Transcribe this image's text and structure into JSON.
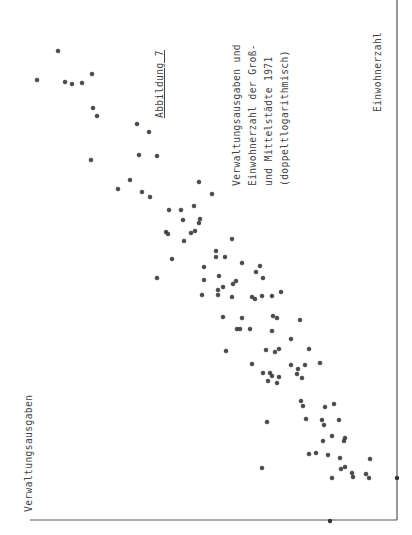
{
  "figure": {
    "label": "Abbildung 7",
    "title_lines": [
      "Verwaltungsausgaben und",
      "Einwohnerzahl der Groß-",
      "und Mittelstädte 1971",
      "(doppeltlogarithmisch)"
    ],
    "x_axis_label": "Einwohnerzahl",
    "y_axis_label": "Verwaltungsausgaben"
  },
  "style": {
    "point_color": "#4a4a4a",
    "axis_color": "#555555",
    "text_color": "#444444"
  },
  "chart_data": {
    "type": "scatter",
    "figure_label": "Abbildung 7",
    "xlabel": "Einwohnerzahl",
    "ylabel": "Verwaltungsausgaben",
    "scale": "log-log",
    "grid": false,
    "legend": null,
    "orientation_note": "Figure printed rotated 90° counter-clockwise; point coordinates are given in page pixel space (px, py).",
    "axes": {
      "x_axis_line": {
        "x": 397,
        "y0": 0,
        "y1": 520
      },
      "y_axis_line": {
        "y": 520,
        "x0": 30,
        "x1": 397
      },
      "axis_markers": [
        {
          "px": 397,
          "py": 478
        },
        {
          "px": 330,
          "py": 521
        }
      ]
    },
    "points": [
      [
        58,
        51
      ],
      [
        37,
        80
      ],
      [
        65,
        82
      ],
      [
        72,
        84
      ],
      [
        82,
        83
      ],
      [
        92,
        74
      ],
      [
        93,
        108
      ],
      [
        97,
        116
      ],
      [
        137,
        124
      ],
      [
        149,
        132
      ],
      [
        91,
        160
      ],
      [
        139,
        155
      ],
      [
        157,
        156
      ],
      [
        130,
        180
      ],
      [
        118,
        189
      ],
      [
        142,
        192
      ],
      [
        150,
        197
      ],
      [
        199,
        182
      ],
      [
        212,
        194
      ],
      [
        194,
        206
      ],
      [
        169,
        210
      ],
      [
        181,
        210
      ],
      [
        183,
        220
      ],
      [
        200,
        219
      ],
      [
        199,
        223
      ],
      [
        166,
        232
      ],
      [
        168,
        234
      ],
      [
        191,
        233
      ],
      [
        195,
        231
      ],
      [
        184,
        241
      ],
      [
        232,
        239
      ],
      [
        216,
        251
      ],
      [
        216,
        257
      ],
      [
        225,
        257
      ],
      [
        172,
        259
      ],
      [
        242,
        263
      ],
      [
        157,
        278
      ],
      [
        204,
        267
      ],
      [
        260,
        266
      ],
      [
        256,
        272
      ],
      [
        219,
        276
      ],
      [
        204,
        280
      ],
      [
        263,
        278
      ],
      [
        236,
        281
      ],
      [
        233,
        284
      ],
      [
        218,
        290
      ],
      [
        223,
        287
      ],
      [
        202,
        295
      ],
      [
        218,
        295
      ],
      [
        232,
        297
      ],
      [
        272,
        296
      ],
      [
        255,
        299
      ],
      [
        262,
        296
      ],
      [
        252,
        297
      ],
      [
        281,
        292
      ],
      [
        223,
        317
      ],
      [
        242,
        318
      ],
      [
        273,
        316
      ],
      [
        277,
        318
      ],
      [
        300,
        320
      ],
      [
        237,
        329
      ],
      [
        240,
        329
      ],
      [
        250,
        329
      ],
      [
        272,
        331
      ],
      [
        291,
        339
      ],
      [
        226,
        351
      ],
      [
        266,
        350
      ],
      [
        275,
        352
      ],
      [
        279,
        349
      ],
      [
        309,
        349
      ],
      [
        252,
        364
      ],
      [
        291,
        365
      ],
      [
        298,
        369
      ],
      [
        305,
        365
      ],
      [
        320,
        363
      ],
      [
        297,
        374
      ],
      [
        263,
        373
      ],
      [
        270,
        373
      ],
      [
        272,
        376
      ],
      [
        279,
        377
      ],
      [
        268,
        381
      ],
      [
        277,
        383
      ],
      [
        302,
        378
      ],
      [
        301,
        401
      ],
      [
        303,
        406
      ],
      [
        325,
        407
      ],
      [
        334,
        404
      ],
      [
        267,
        422
      ],
      [
        306,
        419
      ],
      [
        322,
        420
      ],
      [
        324,
        425
      ],
      [
        339,
        420
      ],
      [
        332,
        436
      ],
      [
        345,
        438
      ],
      [
        344,
        441
      ],
      [
        323,
        441
      ],
      [
        309,
        454
      ],
      [
        316,
        453
      ],
      [
        328,
        455
      ],
      [
        340,
        458
      ],
      [
        370,
        459
      ],
      [
        262,
        468
      ],
      [
        341,
        469
      ],
      [
        345,
        467
      ],
      [
        352,
        473
      ],
      [
        353,
        477
      ],
      [
        366,
        474
      ],
      [
        369,
        478
      ],
      [
        332,
        478
      ]
    ]
  }
}
